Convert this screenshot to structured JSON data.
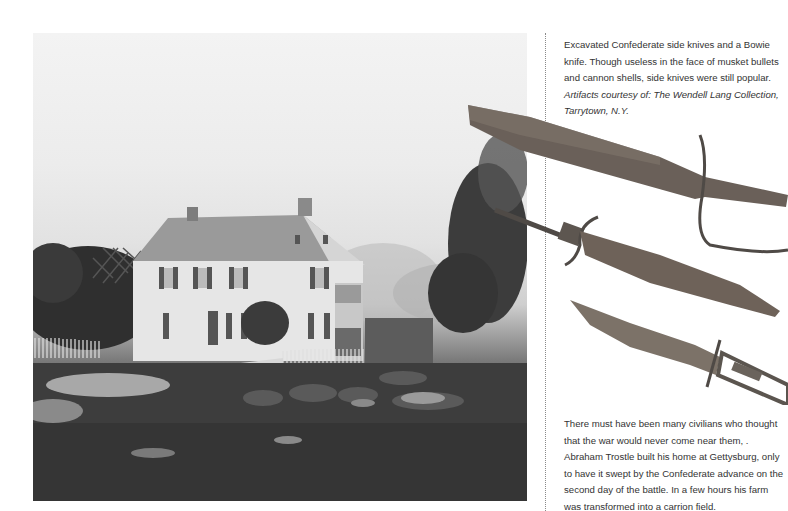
{
  "photo": {
    "subject": "Abraham Trostle farmhouse with battlefield casualties, Gettysburg",
    "tone": "black-and-white"
  },
  "artifacts": {
    "items": [
      {
        "name": "Confederate side knife with D-guard"
      },
      {
        "name": "Confederate side knife with cross guard"
      },
      {
        "name": "Bowie knife with skeleton handle"
      }
    ]
  },
  "captions": {
    "top": {
      "text": "Excavated Confederate side knives and a Bowie knife. Though useless in the face of musket bullets and cannon shells, side knives were still popular.",
      "credit": "Artifacts courtesy of: The Wendell Lang Collection, Tarrytown, N.Y."
    },
    "bottom": {
      "text": "There must have been many civilians who thought that the war would never come near them, . Abraham Trostle built his home at Gettysburg, only to have it swept by the Confederate advance on the second day of the battle. In a few hours his farm was transformed into a carrion field."
    }
  },
  "colors": {
    "paper": "#ffffff",
    "text": "#333333",
    "divider": "#8a8a8a",
    "rust": "#6e6258"
  }
}
